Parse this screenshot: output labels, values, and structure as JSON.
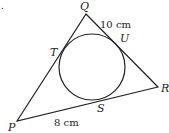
{
  "diagram": {
    "type": "triangle-with-incircle",
    "vertices": {
      "P": "P",
      "Q": "Q",
      "R": "R"
    },
    "tangent_points": {
      "T": "T",
      "U": "U",
      "S": "S"
    },
    "measurements": {
      "QU": "10 cm",
      "PS": "8 cm"
    },
    "stray_mark": "."
  }
}
